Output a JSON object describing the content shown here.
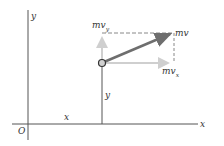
{
  "diagram": {
    "axes": {
      "x_label": "x",
      "y_label": "y",
      "origin_label": "O"
    },
    "coordinates": {
      "x_label": "x",
      "y_label": "y"
    },
    "vectors": {
      "momentum_label": "mv",
      "momentum_x_label": "mv",
      "momentum_x_subscript": "x",
      "momentum_y_label": "mv",
      "momentum_y_subscript": "y"
    },
    "colors": {
      "axis": "#555555",
      "momentum_vector": "#6e6e6e",
      "component_vector": "#cfcfcf",
      "dashed_line": "#888888",
      "particle_fill": "#d0d0d0",
      "particle_stroke": "#333333"
    }
  }
}
